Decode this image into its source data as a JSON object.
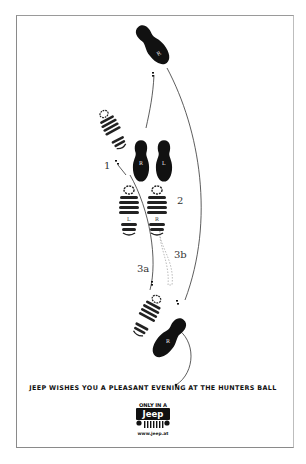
{
  "ad": {
    "step_labels": {
      "step1": "1",
      "step2": "2",
      "step3a": "3a",
      "step3b": "3b"
    },
    "footprints": [
      {
        "id": "sole-top-r",
        "type": "shoe",
        "letter": "R"
      },
      {
        "id": "sole-mid-r",
        "type": "shoe",
        "letter": "R"
      },
      {
        "id": "sole-mid-l",
        "type": "shoe",
        "letter": "L"
      },
      {
        "id": "boot-upper-l",
        "type": "boot",
        "letter": "L"
      },
      {
        "id": "boot-left",
        "type": "boot",
        "letter": "L"
      },
      {
        "id": "boot-right",
        "type": "boot",
        "letter": "R"
      },
      {
        "id": "boot-lower-l",
        "type": "boot",
        "letter": "L"
      },
      {
        "id": "sole-bottom-r",
        "type": "shoe",
        "letter": "R"
      }
    ],
    "tagline": "JEEP WISHES YOU A PLEASANT EVENING AT THE HUNTERS BALL",
    "logo": {
      "top_text": "ONLY IN A",
      "brand": "Jeep",
      "url": "www.jeep.at"
    },
    "colors": {
      "ink": "#111111",
      "background": "#ffffff",
      "frame": "#8a8a8a"
    }
  }
}
